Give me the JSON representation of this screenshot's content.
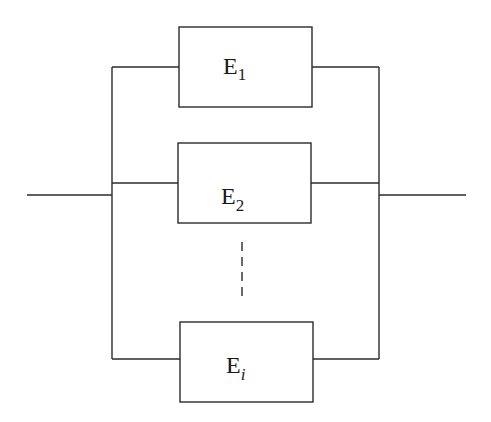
{
  "diagram": {
    "type": "parallel-system-block-diagram",
    "line_color": "#2b2b2b",
    "background": "#ffffff",
    "elements": [
      {
        "id": "E1",
        "base": "E",
        "subscript": "1",
        "subscript_italic": false
      },
      {
        "id": "E2",
        "base": "E",
        "subscript": "2",
        "subscript_italic": false
      },
      {
        "id": "Ei",
        "base": "E",
        "subscript": "i",
        "subscript_italic": true
      }
    ],
    "ellipsis": "vertical-dashed-line"
  }
}
